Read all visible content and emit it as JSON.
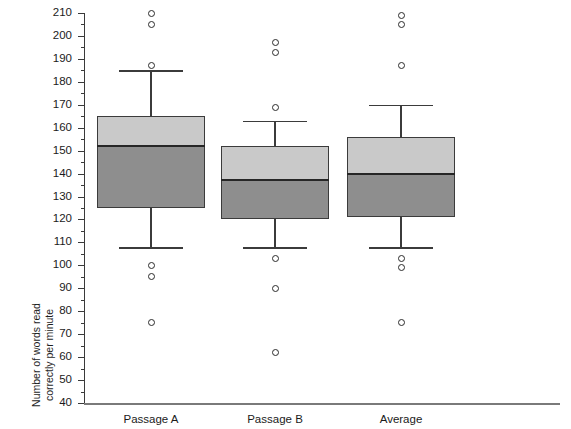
{
  "chart_data": {
    "type": "box",
    "title": "",
    "xlabel": "",
    "ylabel_line1": "Number of words read",
    "ylabel_line2": "correctly per minute",
    "categories": [
      "Passage A",
      "Passage B",
      "Average"
    ],
    "ylim": [
      40,
      210
    ],
    "ytick_step": 10,
    "yticks": [
      40,
      50,
      60,
      70,
      80,
      90,
      100,
      110,
      120,
      130,
      140,
      150,
      160,
      170,
      180,
      190,
      200,
      210
    ],
    "ytick_labels": [
      "40",
      "50",
      "60",
      "70",
      "80",
      "90",
      "100",
      "110",
      "120",
      "130",
      "140",
      "150",
      "160",
      "170",
      "180",
      "190",
      "200",
      "210"
    ],
    "minor_ticks": true,
    "grid": false,
    "legend": "none",
    "colors": {
      "box_upper_fill": "#c9c9c9",
      "box_lower_fill": "#8e8e8e",
      "box_outline": "#3b3b3b",
      "median": "#262626",
      "whisker": "#3b3b3b",
      "outlier_stroke": "#2b2b2b",
      "axis": "#3a3a3a",
      "background": "#ffffff"
    },
    "boxes": [
      {
        "label": "Passage A",
        "whisker_low": 108,
        "q1": 125,
        "median": 152,
        "q3": 165,
        "whisker_high": 185,
        "outliers": [
          210,
          205,
          187,
          100,
          95,
          75
        ]
      },
      {
        "label": "Passage B",
        "whisker_low": 108,
        "q1": 120,
        "median": 137,
        "q3": 152,
        "whisker_high": 163,
        "outliers": [
          197,
          193,
          169,
          103,
          90,
          62
        ]
      },
      {
        "label": "Average",
        "whisker_low": 108,
        "q1": 121,
        "median": 140,
        "q3": 156,
        "whisker_high": 170,
        "outliers": [
          209,
          205,
          187,
          103,
          99,
          75
        ]
      }
    ]
  }
}
